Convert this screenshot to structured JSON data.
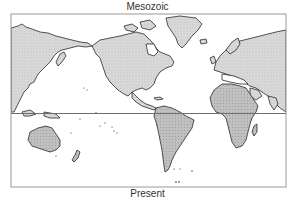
{
  "figure": {
    "top_label": "Mesozoic",
    "bottom_label": "Present",
    "projection": "Pacific-centered world map (Mercator-like)",
    "reference_line": "equator"
  },
  "colors": {
    "frame": "#9a9a9a",
    "equator_line": "#6e6e6e",
    "northern_landmass_fill": "#d6d6d6",
    "southern_landmass_fill": "#bdbdbd",
    "coastline": "#2a2a2a",
    "ocean": "#ffffff"
  },
  "landmasses": [
    {
      "name": "Eurasia (east)",
      "shade": "light"
    },
    {
      "name": "North America",
      "shade": "light"
    },
    {
      "name": "Greenland",
      "shade": "light"
    },
    {
      "name": "Europe / Eurasia (west)",
      "shade": "light"
    },
    {
      "name": "South America",
      "shade": "dark"
    },
    {
      "name": "Africa",
      "shade": "dark"
    },
    {
      "name": "Australia",
      "shade": "dark"
    },
    {
      "name": "India",
      "shade": "light"
    },
    {
      "name": "Madagascar",
      "shade": "dark"
    },
    {
      "name": "New Zealand",
      "shade": "dark"
    }
  ]
}
